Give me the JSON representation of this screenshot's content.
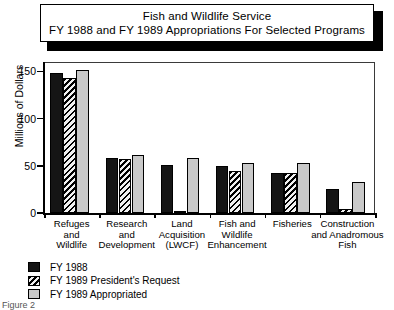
{
  "title": {
    "line1": "Fish and Wildlife Service",
    "line2": "FY 1988 and FY 1989 Appropriations For Selected Programs"
  },
  "caption": "Figure 2",
  "legend": {
    "items": [
      {
        "label": "FY 1988",
        "color": "#151515",
        "pattern": "solid"
      },
      {
        "label": "FY 1989 President's Request",
        "color": "#f2f2f2",
        "pattern": "diagonal-hatch"
      },
      {
        "label": "FY 1989 Appropriated",
        "color": "#c9c9c9",
        "pattern": "solid"
      }
    ]
  },
  "axis": {
    "y_title": "Millions of Dollars",
    "y_ticks": [
      "0",
      "50",
      "100",
      "150"
    ]
  },
  "categories_lines": [
    [
      "Refuges",
      "and",
      "Wildlife"
    ],
    [
      "Research",
      "and",
      "Development"
    ],
    [
      "Land",
      "Acquisition",
      "(LWCF)"
    ],
    [
      "Fish and",
      "Wildlife",
      "Enhancement"
    ],
    [
      "Fisheries",
      "",
      ""
    ],
    [
      "Construction",
      "and Anadromous",
      "Fish"
    ]
  ],
  "chart_data": {
    "type": "bar",
    "xlabel": "",
    "ylabel": "Millions of Dollars",
    "ylim": [
      0,
      160
    ],
    "yticks": [
      0,
      50,
      100,
      150
    ],
    "grid": false,
    "legend_position": "below-left",
    "categories": [
      "Refuges and Wildlife",
      "Research and Development",
      "Land Acquisition (LWCF)",
      "Fish and Wildlife Enhancement",
      "Fisheries",
      "Construction and Anadromous Fish"
    ],
    "series": [
      {
        "name": "FY 1988",
        "values": [
          148,
          58,
          51,
          50,
          42,
          25
        ]
      },
      {
        "name": "FY 1989 President's Request",
        "values": [
          143,
          57,
          1,
          45,
          42,
          4
        ]
      },
      {
        "name": "FY 1989 Appropriated",
        "values": [
          152,
          62,
          58,
          53,
          53,
          33
        ]
      }
    ]
  }
}
